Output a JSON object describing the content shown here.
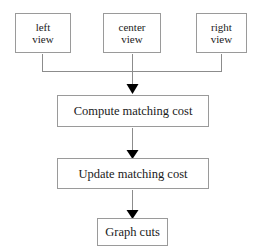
{
  "diagram": {
    "type": "flowchart",
    "background_color": "#ffffff",
    "box_border_color": "#9a9a9a",
    "connector_color": "#8c8c8c",
    "arrowhead_color": "#000000",
    "text_color": "#1a1a1a"
  },
  "nodes": {
    "left_view": {
      "line1": "left",
      "line2": "view"
    },
    "center_view": {
      "line1": "center",
      "line2": "view"
    },
    "right_view": {
      "line1": "right",
      "line2": "view"
    },
    "compute": {
      "label": "Compute matching cost"
    },
    "update": {
      "label": "Update matching cost"
    },
    "graph_cuts": {
      "label": "Graph cuts"
    }
  },
  "connectors": [
    {
      "name": "left-view-to-merge",
      "from": "left_view",
      "to": "merge-bar",
      "style": "elbow",
      "arrowhead": false
    },
    {
      "name": "center-view-to-compute",
      "from": "center_view",
      "to": "compute",
      "style": "straight",
      "arrowhead": true
    },
    {
      "name": "right-view-to-merge",
      "from": "right_view",
      "to": "merge-bar",
      "style": "elbow",
      "arrowhead": false
    },
    {
      "name": "compute-to-update",
      "from": "compute",
      "to": "update",
      "style": "straight",
      "arrowhead": true
    },
    {
      "name": "update-to-graph-cuts",
      "from": "update",
      "to": "graph_cuts",
      "style": "straight",
      "arrowhead": true
    }
  ]
}
